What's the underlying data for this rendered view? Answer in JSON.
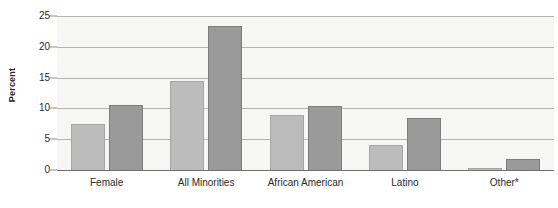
{
  "chart_data": {
    "type": "bar",
    "title": "",
    "subtitle": "",
    "xlabel": "",
    "ylabel": "Percent",
    "ylim": [
      0,
      25
    ],
    "yticks": [
      0,
      5,
      10,
      15,
      20,
      25
    ],
    "ytick_labels": [
      "0",
      "5",
      "10",
      "15",
      "20",
      "25"
    ],
    "grid": true,
    "legend_position": "none",
    "categories": [
      "Female",
      "All Minorities",
      "African American",
      "Latino",
      "Other*"
    ],
    "series": [
      {
        "name": "series-1",
        "color": "#bcbcbc",
        "values": [
          7.5,
          14.4,
          8.9,
          4.1,
          0.4
        ]
      },
      {
        "name": "series-2",
        "color": "#9a9a9a",
        "values": [
          10.5,
          23.3,
          10.4,
          8.5,
          1.8
        ]
      }
    ],
    "annotations": [
      "Other*"
    ]
  },
  "colors": {
    "plot_background": "#f6f6f4",
    "gridline": "#b4b4b4",
    "axis": "#6f6f6f",
    "text": "#2b2b2b",
    "series_light": "#bcbcbc",
    "series_light_edge": "#a6a6a6",
    "series_dark": "#9a9a9a",
    "series_dark_edge": "#7d7d7d"
  }
}
